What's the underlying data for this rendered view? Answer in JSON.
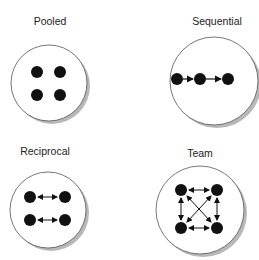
{
  "diagram": {
    "panels": [
      {
        "label": "Pooled",
        "nodes": 4,
        "connections": "none"
      },
      {
        "label": "Sequential",
        "nodes": 3,
        "connections": "one-way chain"
      },
      {
        "label": "Reciprocal",
        "nodes": 4,
        "connections": "two-way pairs"
      },
      {
        "label": "Team",
        "nodes": 4,
        "connections": "all two-way"
      }
    ]
  },
  "colors": {
    "node": "#111111",
    "circle_fill": "#ffffff",
    "circle_stroke": "#555555",
    "shadow": "#9a9a9a"
  }
}
